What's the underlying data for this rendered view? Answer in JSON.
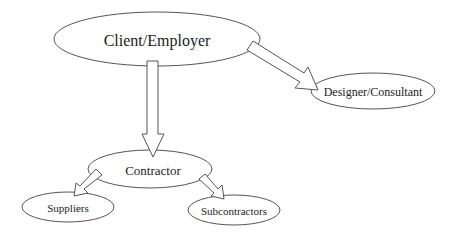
{
  "diagram": {
    "type": "hierarchy",
    "nodes": [
      {
        "id": "client",
        "label": "Client/Employer"
      },
      {
        "id": "designer",
        "label": "Designer/Consultant"
      },
      {
        "id": "contractor",
        "label": "Contractor"
      },
      {
        "id": "suppliers",
        "label": "Suppliers"
      },
      {
        "id": "subcontractors",
        "label": "Subcontractors"
      }
    ],
    "edges": [
      {
        "from": "client",
        "to": "designer"
      },
      {
        "from": "client",
        "to": "contractor"
      },
      {
        "from": "contractor",
        "to": "suppliers"
      },
      {
        "from": "contractor",
        "to": "subcontractors"
      }
    ]
  }
}
